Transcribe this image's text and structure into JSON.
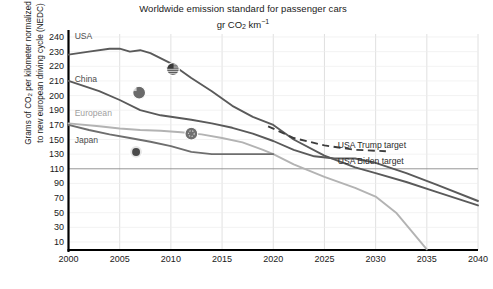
{
  "chart_data": {
    "type": "line",
    "title": "Worldwide emission standard for passenger cars",
    "subtitle": "gr CO2 km-1",
    "subtitle_parts": {
      "prefix": "gr CO",
      "sub": "2",
      "mid": " km",
      "sup": "−1"
    },
    "xlabel": "",
    "ylabel_line1": "Grams of CO2 per kilometer normalized",
    "ylabel_line2": "to new european driving cycle (NEDC)",
    "ylabel_parts": {
      "a": "Grams of CO",
      "sub": "2",
      "b": " per kilometer normalized",
      "c": "to new european driving cycle (NEDC)"
    },
    "xlim": [
      2000,
      2040
    ],
    "ylim": [
      0,
      245
    ],
    "xticks": [
      2000,
      2005,
      2010,
      2015,
      2020,
      2025,
      2030,
      2035,
      2040
    ],
    "yticks": [
      240,
      230,
      220,
      210,
      200,
      190,
      170,
      150,
      130,
      110,
      90,
      70,
      50,
      30,
      10
    ],
    "grid": true,
    "legend_position": "inline-labels",
    "series": [
      {
        "name": "USA",
        "color": "#5a5a5a",
        "label_x": 2000.6,
        "label_y": 241,
        "x": [
          2000,
          2002,
          2004,
          2005,
          2006,
          2007,
          2008,
          2010,
          2012,
          2014,
          2016,
          2018,
          2020,
          2022,
          2025,
          2028,
          2030,
          2033,
          2036,
          2040
        ],
        "y": [
          228,
          230,
          232,
          232,
          230,
          231,
          229,
          222,
          212,
          203,
          193,
          181,
          170,
          150,
          128,
          112,
          104,
          92,
          78,
          60
        ]
      },
      {
        "name": "China",
        "color": "#5a5a5a",
        "label_x": 2000.6,
        "label_y": 211,
        "x": [
          2000,
          2003,
          2005,
          2007,
          2009,
          2010,
          2012,
          2014,
          2016,
          2018,
          2020,
          2022,
          2024,
          2026,
          2028,
          2030,
          2033,
          2036,
          2040
        ],
        "y": [
          210,
          203,
          197,
          190,
          183,
          181,
          177,
          172,
          166,
          158,
          148,
          136,
          127,
          124,
          124,
          118,
          104,
          88,
          66
        ]
      },
      {
        "name": "European",
        "color": "#b3b3b3",
        "label_x": 2000.6,
        "label_y": 186,
        "x": [
          2000,
          2003,
          2005,
          2007,
          2009,
          2011,
          2013,
          2015,
          2017,
          2019,
          2020,
          2022,
          2025,
          2028,
          2030,
          2032,
          2035
        ],
        "y": [
          172,
          168,
          165,
          163,
          162,
          160,
          157,
          152,
          146,
          136,
          130,
          116,
          99,
          84,
          72,
          50,
          0
        ]
      },
      {
        "name": "Japan",
        "color": "#6e6e6e",
        "label_x": 2000.6,
        "label_y": 150,
        "x": [
          2000,
          2002,
          2004,
          2006,
          2008,
          2010,
          2012,
          2014,
          2016,
          2018,
          2020
        ],
        "y": [
          170,
          163,
          157,
          152,
          147,
          141,
          133,
          130,
          130,
          130,
          130
        ]
      }
    ],
    "annotations": [
      {
        "name": "USA Trump target",
        "text": "USA Trump target",
        "style": "dashed",
        "color": "#3d3d3d",
        "label_x": 2026.3,
        "label_y": 142,
        "x": [
          2019.5,
          2022,
          2025,
          2028,
          2031
        ],
        "y": [
          168,
          152,
          142,
          136,
          134
        ]
      },
      {
        "name": "USA Biden target",
        "text": "USA Biden target",
        "style": "solid-reference",
        "color": "#8a8a8a",
        "label_x": 2026.3,
        "label_y": 120,
        "value": 110
      }
    ],
    "markers": [
      {
        "name": "usa-flag-marker",
        "country": "USA",
        "x": 2010.2,
        "y": 218
      },
      {
        "name": "china-flag-marker",
        "country": "China",
        "x": 2006.9,
        "y": 202
      },
      {
        "name": "european-flag-marker",
        "country": "European",
        "x": 2012.0,
        "y": 158
      },
      {
        "name": "japan-flag-marker",
        "country": "Japan",
        "x": 2006.6,
        "y": 133
      }
    ]
  }
}
